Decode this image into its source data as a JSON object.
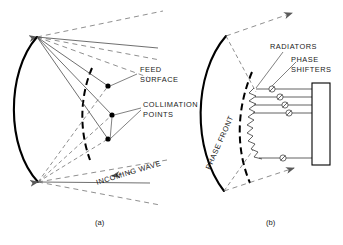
{
  "figure": {
    "panels": [
      {
        "id": "a",
        "caption": "(a)",
        "labels": [
          {
            "name": "feed-surface",
            "text_line1": "FEED",
            "text_line2": "SURFACE"
          },
          {
            "name": "collimation-points",
            "text_line1": "COLLIMATION",
            "text_line2": "POINTS"
          },
          {
            "name": "incoming-wave",
            "text": "INCOMING WAVE",
            "rotation_deg": -17
          }
        ],
        "elements": {
          "lens_arc": "curved lens aperture, bulging left",
          "apex_top": "ray convergence point at top of lens",
          "apex_bottom": "ray convergence point at bottom of lens",
          "collimation_dot_count": 3,
          "feed_surface_style": "dashed arc"
        }
      },
      {
        "id": "b",
        "caption": "(b)",
        "labels": [
          {
            "name": "radiators",
            "text": "RADIATORS"
          },
          {
            "name": "phase-shifters",
            "text_line1": "PHASE",
            "text_line2": "SHIFTERS"
          },
          {
            "name": "phase-front",
            "text": "PHASE FRONT",
            "rotation_deg": -66
          }
        ],
        "elements": {
          "lens_arc": "curved lens aperture, bulging left",
          "phase_front_style": "dashed arc",
          "radiator_count": 9,
          "phase_shifter_count": 4,
          "beam_former_block": "rectangular block at right",
          "beam_arrow_count": 2
        }
      }
    ],
    "colors": {
      "ink": "#000000",
      "text": "#1a1a1a",
      "ray": "#4a4a4a",
      "dashed": "#6a6a6a",
      "background": "#ffffff"
    }
  }
}
